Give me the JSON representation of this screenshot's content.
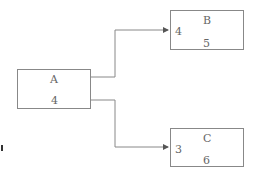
{
  "nodes": {
    "A": {
      "title": "A",
      "value": "4"
    },
    "B": {
      "title": "B",
      "in_port": "4",
      "value": "5"
    },
    "C": {
      "title": "C",
      "in_port": "3",
      "value": "6"
    }
  },
  "edges": [
    {
      "from": "A",
      "to": "B"
    },
    {
      "from": "A",
      "to": "C"
    }
  ],
  "colors": {
    "stroke": "#888888",
    "text": "#666666"
  }
}
